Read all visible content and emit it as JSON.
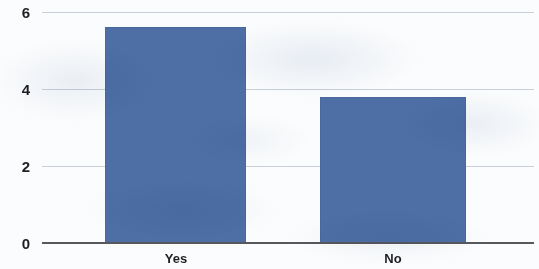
{
  "chart_data": {
    "type": "bar",
    "title": "",
    "subtitle": "",
    "xlabel": "",
    "ylabel": "",
    "categories": [
      "Yes",
      "No"
    ],
    "values": [
      5.6,
      3.8
    ],
    "series": [
      {
        "name": "",
        "values": [
          5.6,
          3.8
        ]
      }
    ],
    "ylim": [
      0,
      6
    ],
    "yticks": [
      0,
      2,
      4,
      6
    ],
    "ytick_labels": [
      "0",
      "2",
      "4",
      "6"
    ],
    "grid": true,
    "legend": false,
    "legend_position": "none",
    "bar_color": "#4d6fa6",
    "gridline_color": "#c9d0d8",
    "axis_color": "#56585c",
    "background_color": "#fbfcfd",
    "annotations": []
  }
}
